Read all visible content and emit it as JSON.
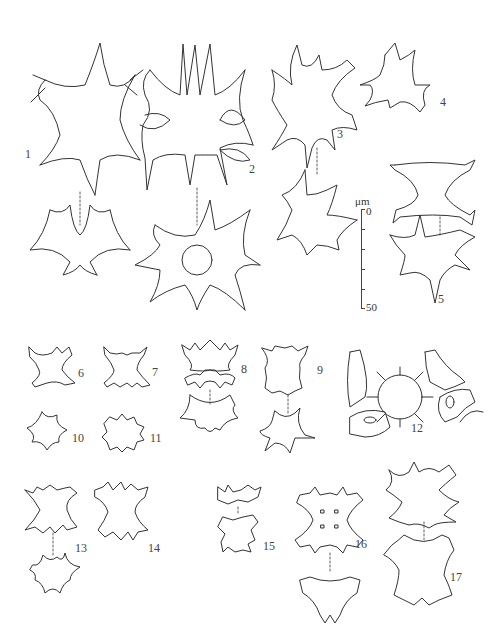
{
  "plate": {
    "description": "Line drawings of desmid algae cells, figures 1-17, with scale bar",
    "figures": [
      {
        "id": "fig-1",
        "label": "1"
      },
      {
        "id": "fig-2",
        "label": "2"
      },
      {
        "id": "fig-3",
        "label": "3"
      },
      {
        "id": "fig-4",
        "label": "4"
      },
      {
        "id": "fig-5",
        "label": "5"
      },
      {
        "id": "fig-6",
        "label": "6"
      },
      {
        "id": "fig-7",
        "label": "7"
      },
      {
        "id": "fig-8",
        "label": "8"
      },
      {
        "id": "fig-9",
        "label": "9"
      },
      {
        "id": "fig-10",
        "label": "10"
      },
      {
        "id": "fig-11",
        "label": "11"
      },
      {
        "id": "fig-12",
        "label": "12"
      },
      {
        "id": "fig-13",
        "label": "13"
      },
      {
        "id": "fig-14",
        "label": "14"
      },
      {
        "id": "fig-15",
        "label": "15"
      },
      {
        "id": "fig-16",
        "label": "16"
      },
      {
        "id": "fig-17",
        "label": "17"
      }
    ],
    "scale_bar": {
      "unit": "μm",
      "min_label": "0",
      "max_label": "50",
      "ticks": 6
    }
  }
}
